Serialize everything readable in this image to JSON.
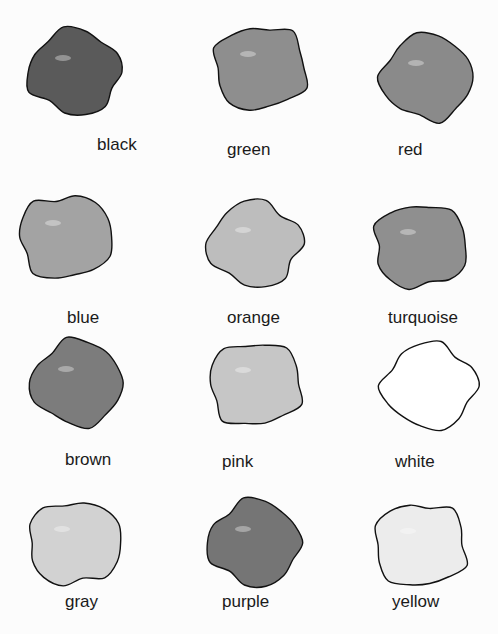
{
  "swatches": [
    {
      "label": "black",
      "fill": "#5a5a5a",
      "cx": 75,
      "cy": 72,
      "lx": 97,
      "ly": 135
    },
    {
      "label": "green",
      "fill": "#8e8e8e",
      "cx": 260,
      "cy": 68,
      "lx": 227,
      "ly": 140
    },
    {
      "label": "red",
      "fill": "#8a8a8a",
      "cx": 428,
      "cy": 77,
      "lx": 398,
      "ly": 140
    },
    {
      "label": "blue",
      "fill": "#a3a3a3",
      "cx": 65,
      "cy": 237,
      "lx": 67,
      "ly": 308
    },
    {
      "label": "orange",
      "fill": "#bdbdbd",
      "cx": 255,
      "cy": 244,
      "lx": 227,
      "ly": 308
    },
    {
      "label": "turquoise",
      "fill": "#8f8f8f",
      "cx": 420,
      "cy": 246,
      "lx": 388,
      "ly": 308
    },
    {
      "label": "brown",
      "fill": "#7c7c7c",
      "cx": 78,
      "cy": 383,
      "lx": 65,
      "ly": 450
    },
    {
      "label": "pink",
      "fill": "#c6c6c6",
      "cx": 255,
      "cy": 384,
      "lx": 222,
      "ly": 452
    },
    {
      "label": "white",
      "fill": "#ffffff",
      "cx": 430,
      "cy": 386,
      "lx": 395,
      "ly": 452
    },
    {
      "label": "gray",
      "fill": "#d2d2d2",
      "cx": 74,
      "cy": 543,
      "lx": 65,
      "ly": 592
    },
    {
      "label": "purple",
      "fill": "#757575",
      "cx": 255,
      "cy": 543,
      "lx": 222,
      "ly": 592
    },
    {
      "label": "yellow",
      "fill": "#ececec",
      "cx": 420,
      "cy": 545,
      "lx": 392,
      "ly": 592
    }
  ]
}
